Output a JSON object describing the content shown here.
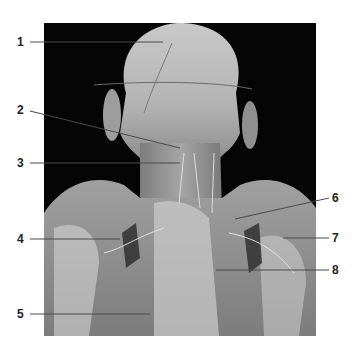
{
  "figure": {
    "background_color": "#050505",
    "tissue_tones": [
      "#8c8c8c",
      "#a9a9a9",
      "#c6c6c6",
      "#d9d9d9",
      "#6e6e6e"
    ]
  },
  "callouts": [
    {
      "number": "1",
      "side": "left",
      "label_x": 22,
      "label_y": 42,
      "line": [
        [
          30,
          42
        ],
        [
          163,
          42
        ]
      ]
    },
    {
      "number": "2",
      "side": "left",
      "label_x": 22,
      "label_y": 110,
      "line": [
        [
          30,
          111
        ],
        [
          180,
          148
        ]
      ]
    },
    {
      "number": "3",
      "side": "left",
      "label_x": 22,
      "label_y": 163,
      "line": [
        [
          30,
          163
        ],
        [
          180,
          163
        ]
      ]
    },
    {
      "number": "4",
      "side": "left",
      "label_x": 22,
      "label_y": 239,
      "line": [
        [
          30,
          239
        ],
        [
          120,
          239
        ]
      ]
    },
    {
      "number": "5",
      "side": "left",
      "label_x": 22,
      "label_y": 314,
      "line": [
        [
          30,
          314
        ],
        [
          150,
          314
        ]
      ]
    },
    {
      "number": "6",
      "side": "right",
      "label_x": 332,
      "label_y": 198,
      "line": [
        [
          329,
          198
        ],
        [
          235,
          219
        ]
      ]
    },
    {
      "number": "7",
      "side": "right",
      "label_x": 332,
      "label_y": 238,
      "line": [
        [
          329,
          238
        ],
        [
          283,
          238
        ]
      ]
    },
    {
      "number": "8",
      "side": "right",
      "label_x": 332,
      "label_y": 270,
      "line": [
        [
          329,
          270
        ],
        [
          216,
          270
        ]
      ]
    }
  ]
}
